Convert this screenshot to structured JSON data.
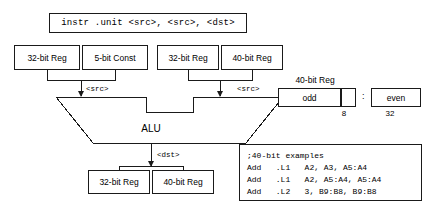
{
  "instruction": {
    "text": "instr  .unit  <src>, <src>, <dst>"
  },
  "sources": {
    "left_group": [
      {
        "label": "32-bit Reg"
      },
      {
        "label": "5-bit Const"
      }
    ],
    "right_group": [
      {
        "label": "32-bit Reg"
      },
      {
        "label": "40-bit Reg"
      }
    ],
    "left_wire_label": "<src>",
    "right_wire_label": "<src>"
  },
  "alu": {
    "label": "ALU"
  },
  "destinations": {
    "wire_label": "<dst>",
    "boxes": [
      {
        "label": "32-bit Reg"
      },
      {
        "label": "40-bit Reg"
      }
    ]
  },
  "register40": {
    "title": "40-bit Reg",
    "odd_label": "odd",
    "even_label": "even",
    "separator": ":",
    "odd_width": "8",
    "even_width": "32"
  },
  "examples": {
    "lines": [
      ";40-bit examples",
      "Add   .L1   A2, A3, A5:A4",
      "Add   .L1   A2, A5:A4, A5:A4",
      "Add   .L2   3, B9:B8, B9:B8"
    ]
  },
  "colors": {
    "stroke": "#1a1a1a",
    "background": "#ffffff",
    "text": "#000000"
  }
}
